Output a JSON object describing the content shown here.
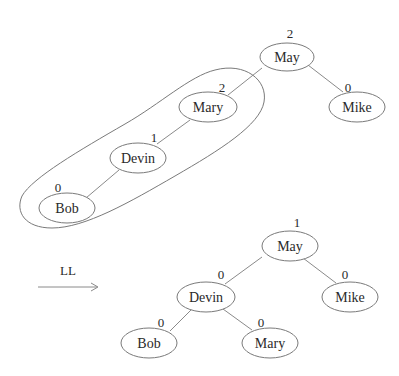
{
  "diagram": {
    "type": "AVL tree rotation",
    "rotation_label": "LL",
    "before": {
      "nodes": [
        {
          "id": "may",
          "label": "May",
          "balance": "2"
        },
        {
          "id": "mary",
          "label": "Mary",
          "balance": "2"
        },
        {
          "id": "mike",
          "label": "Mike",
          "balance": "0"
        },
        {
          "id": "devin",
          "label": "Devin",
          "balance": "1"
        },
        {
          "id": "bob",
          "label": "Bob",
          "balance": "0"
        }
      ],
      "edges": [
        [
          "May",
          "Mary"
        ],
        [
          "May",
          "Mike"
        ],
        [
          "Mary",
          "Devin"
        ],
        [
          "Devin",
          "Bob"
        ]
      ],
      "highlight_group": [
        "Mary",
        "Devin",
        "Bob"
      ]
    },
    "after": {
      "nodes": [
        {
          "id": "may",
          "label": "May",
          "balance": "1"
        },
        {
          "id": "devin",
          "label": "Devin",
          "balance": "0"
        },
        {
          "id": "mike",
          "label": "Mike",
          "balance": "0"
        },
        {
          "id": "bob",
          "label": "Bob",
          "balance": "0"
        },
        {
          "id": "mary",
          "label": "Mary",
          "balance": "0"
        }
      ],
      "edges": [
        [
          "May",
          "Devin"
        ],
        [
          "May",
          "Mike"
        ],
        [
          "Devin",
          "Bob"
        ],
        [
          "Devin",
          "Mary"
        ]
      ]
    }
  }
}
